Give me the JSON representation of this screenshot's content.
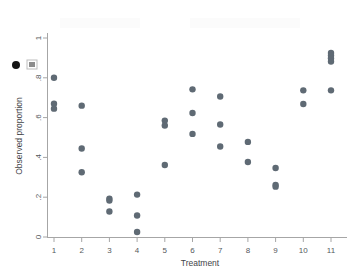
{
  "chart_data": {
    "type": "scatter",
    "title": "",
    "xlabel": "Treatment",
    "ylabel": "Observed proportion",
    "xlim": [
      0.45,
      11.55
    ],
    "ylim": [
      0,
      1
    ],
    "xticks": [
      1,
      2,
      3,
      4,
      5,
      6,
      7,
      8,
      9,
      10,
      11
    ],
    "xtick_labels": [
      "1",
      "2",
      "3",
      "4",
      "5",
      "6",
      "7",
      "8",
      "9",
      "10",
      "11"
    ],
    "yticks": [
      0,
      0.2,
      0.4,
      0.6,
      0.8,
      1
    ],
    "ytick_labels": [
      "0",
      ".2",
      ".4",
      ".6",
      ".8",
      "1"
    ],
    "grid": false,
    "legend": "none",
    "marker_color": "#5f6a74",
    "marker_size": 3.2,
    "points": [
      {
        "x": 1,
        "y": 0.8
      },
      {
        "x": 1,
        "y": 0.67
      },
      {
        "x": 1,
        "y": 0.645
      },
      {
        "x": 2,
        "y": 0.66
      },
      {
        "x": 2,
        "y": 0.445
      },
      {
        "x": 2,
        "y": 0.325
      },
      {
        "x": 3,
        "y": 0.193
      },
      {
        "x": 3,
        "y": 0.183
      },
      {
        "x": 3,
        "y": 0.128
      },
      {
        "x": 4,
        "y": 0.213
      },
      {
        "x": 4,
        "y": 0.108
      },
      {
        "x": 4,
        "y": 0.025
      },
      {
        "x": 5,
        "y": 0.585
      },
      {
        "x": 5,
        "y": 0.56
      },
      {
        "x": 5,
        "y": 0.362
      },
      {
        "x": 6,
        "y": 0.742
      },
      {
        "x": 6,
        "y": 0.623
      },
      {
        "x": 6,
        "y": 0.518
      },
      {
        "x": 7,
        "y": 0.706
      },
      {
        "x": 7,
        "y": 0.565
      },
      {
        "x": 7,
        "y": 0.455
      },
      {
        "x": 8,
        "y": 0.478
      },
      {
        "x": 8,
        "y": 0.377
      },
      {
        "x": 9,
        "y": 0.347
      },
      {
        "x": 9,
        "y": 0.262
      },
      {
        "x": 9,
        "y": 0.253
      },
      {
        "x": 10,
        "y": 0.737
      },
      {
        "x": 10,
        "y": 0.668
      },
      {
        "x": 11,
        "y": 0.925
      },
      {
        "x": 11,
        "y": 0.912
      },
      {
        "x": 11,
        "y": 0.898
      },
      {
        "x": 11,
        "y": 0.882
      },
      {
        "x": 11,
        "y": 0.737
      }
    ],
    "stray_marker": {
      "px": 16,
      "py": 65,
      "color": "#151515"
    }
  },
  "axes": {
    "x_title": "Treatment",
    "y_title": "Observed proportion"
  }
}
